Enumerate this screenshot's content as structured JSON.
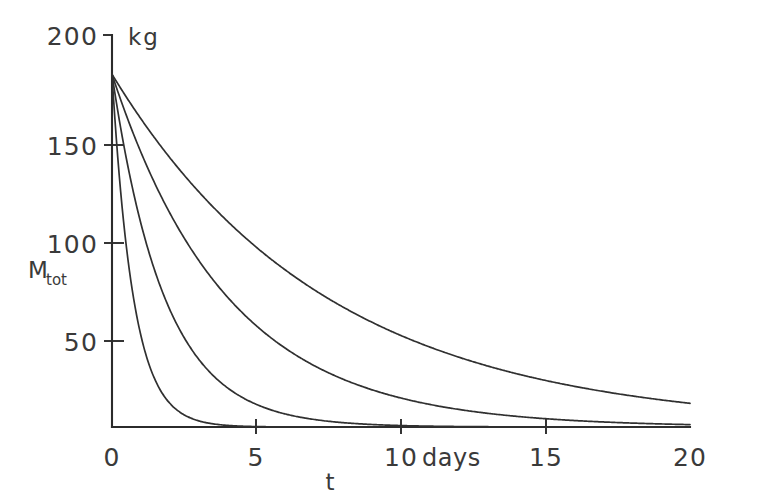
{
  "chart_data": {
    "type": "line",
    "title": "",
    "subtitle": "",
    "xlabel": "t",
    "ylabel": "M_tot",
    "y_unit": "kg",
    "x_unit": "days",
    "xlim": [
      0,
      20
    ],
    "ylim": [
      0,
      200
    ],
    "grid": false,
    "legend": false,
    "legend_position": "none",
    "x_ticks": [
      0,
      5,
      10,
      15,
      20
    ],
    "x_tick_labels": [
      "0",
      "5",
      "10",
      "15",
      "20"
    ],
    "x_tick_extra_label": "days",
    "y_ticks": [
      0,
      50,
      100,
      150,
      200
    ],
    "y_tick_labels": [
      "0",
      "50",
      "100",
      "150",
      "200"
    ],
    "y_tick_labels_drawn": [
      "50",
      "100",
      "150",
      "200"
    ],
    "x": [
      0,
      0.25,
      0.5,
      0.75,
      1,
      1.5,
      2,
      2.5,
      3,
      3.5,
      4,
      5,
      6,
      7,
      8,
      9,
      10,
      11,
      12,
      13,
      14,
      15,
      16,
      17,
      18,
      19,
      20
    ],
    "series": [
      {
        "name": "curve-1-slow",
        "decay_rate_per_day": 0.135,
        "initial_value": 180,
        "values": [
          180,
          174,
          168.3,
          162.7,
          157.3,
          147,
          137.4,
          128.4,
          120,
          112.2,
          104.8,
          91.6,
          80.1,
          70,
          61.2,
          53.5,
          46.8,
          40.9,
          35.8,
          31.3,
          27.4,
          23.9,
          20.9,
          18.3,
          16,
          14,
          12.2
        ]
      },
      {
        "name": "curve-2",
        "decay_rate_per_day": 0.25,
        "initial_value": 180,
        "values": [
          180,
          169.1,
          158.8,
          149.2,
          140.2,
          123.7,
          109.2,
          96.3,
          85,
          75,
          66.2,
          51.6,
          40.2,
          31.3,
          24.4,
          19,
          14.8,
          11.5,
          9,
          7,
          5.4,
          4.2,
          3.3,
          2.6,
          2,
          1.6,
          1.2
        ]
      },
      {
        "name": "curve-3",
        "decay_rate_per_day": 0.55,
        "initial_value": 180,
        "values": [
          180,
          156.9,
          136.8,
          119.3,
          104,
          79.1,
          59.9,
          45.5,
          34.6,
          26.3,
          20,
          11.5,
          6.6,
          3.8,
          2.2,
          1.3,
          0.7,
          0.4,
          0.3,
          0.15,
          0.09,
          0.05,
          0.03,
          0.02,
          0.01,
          0.01,
          0.005
        ]
      },
      {
        "name": "curve-4-fast",
        "decay_rate_per_day": 1.35,
        "initial_value": 180,
        "values": [
          180,
          128.5,
          91.7,
          65.4,
          46.7,
          23.8,
          12.1,
          6.2,
          3.1,
          1.6,
          0.8,
          0.2,
          0.05,
          0.015,
          0.004,
          0.001,
          0.0003,
          0,
          0,
          0,
          0,
          0,
          0,
          0,
          0,
          0,
          0
        ]
      }
    ]
  },
  "axis": {
    "y_unit_label": "kg",
    "y_title_main": "M",
    "y_title_sub": "tot",
    "x_title": "t",
    "x_days_label": "days"
  },
  "colors": {
    "background": "#ffffff",
    "ink": "#2b2b2b",
    "curve": "#303030",
    "text": "#3a3a3a"
  }
}
